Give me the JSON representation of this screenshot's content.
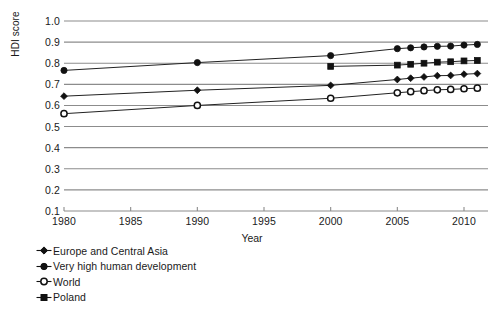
{
  "chart_data": {
    "type": "line",
    "title": "",
    "xlabel": "Year",
    "ylabel": "HDI score",
    "xlim": [
      1980,
      2011.8
    ],
    "ylim": [
      0.1,
      1.0
    ],
    "grid": true,
    "legend_position": "below-left",
    "xticks": [
      1980,
      1985,
      1990,
      1995,
      2000,
      2005,
      2010
    ],
    "xticklabels": [
      "1980",
      "1985",
      "1990",
      "1995",
      "2000",
      "2005",
      "2010"
    ],
    "yticks": [
      0.1,
      0.2,
      0.3,
      0.4,
      0.5,
      0.6,
      0.7,
      0.8,
      0.9,
      1.0
    ],
    "yticklabels": [
      "0.1",
      "0.2",
      "0.3",
      "0.4",
      "0.5",
      "0.6",
      "0.7",
      "0.8",
      "0.9",
      "1.0"
    ],
    "series": [
      {
        "name": "Europe and Central Asia",
        "marker": "diamond",
        "color": "#111111",
        "x": [
          1980,
          1990,
          2000,
          2005,
          2006,
          2007,
          2008,
          2009,
          2010,
          2011
        ],
        "values": [
          0.644,
          0.672,
          0.695,
          0.723,
          0.729,
          0.735,
          0.741,
          0.742,
          0.748,
          0.751
        ]
      },
      {
        "name": "Very high human development",
        "marker": "circle-filled",
        "color": "#111111",
        "x": [
          1980,
          1990,
          2000,
          2005,
          2006,
          2007,
          2008,
          2009,
          2010,
          2011
        ],
        "values": [
          0.766,
          0.803,
          0.836,
          0.869,
          0.873,
          0.877,
          0.88,
          0.881,
          0.886,
          0.889
        ]
      },
      {
        "name": "World",
        "marker": "circle-open",
        "color": "#111111",
        "x": [
          1980,
          1990,
          2000,
          2005,
          2006,
          2007,
          2008,
          2009,
          2010,
          2011
        ],
        "values": [
          0.561,
          0.6,
          0.634,
          0.66,
          0.665,
          0.67,
          0.674,
          0.676,
          0.679,
          0.682
        ]
      },
      {
        "name": "Poland",
        "marker": "square",
        "color": "#111111",
        "x": [
          2000,
          2005,
          2006,
          2007,
          2008,
          2009,
          2010,
          2011
        ],
        "values": [
          0.785,
          0.791,
          0.795,
          0.8,
          0.805,
          0.807,
          0.811,
          0.813
        ]
      }
    ]
  },
  "legend": {
    "items": [
      {
        "label": "Europe and Central Asia",
        "marker": "diamond"
      },
      {
        "label": "Very high human development",
        "marker": "circle-filled"
      },
      {
        "label": "World",
        "marker": "circle-open"
      },
      {
        "label": "Poland",
        "marker": "square"
      }
    ]
  },
  "style": {
    "grid_color": "#8c8c8c",
    "line_color": "#222222",
    "marker_color": "#111111",
    "text_color": "#1a1a1a"
  }
}
